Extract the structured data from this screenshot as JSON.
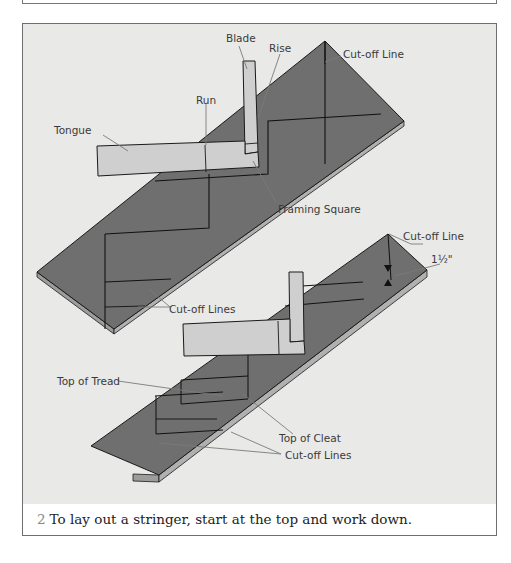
{
  "figure": {
    "number": "2",
    "caption": "To lay out a stringer, start at the top and work down.",
    "colors": {
      "background": "#e9e9e7",
      "stringer_face": "#6f6f6f",
      "stringer_edge": "#a8a8a8",
      "framing_square": "#cfcfcf",
      "outline": "#1a1a1a",
      "leader": "#7a7a7a"
    },
    "top_diagram": {
      "labels": {
        "blade": "Blade",
        "rise": "Rise",
        "run": "Run",
        "tongue": "Tongue",
        "cutoff_line": "Cut-off Line",
        "framing_square": "Framing Square",
        "cutoff_lines": "Cut-off Lines"
      }
    },
    "bottom_diagram": {
      "labels": {
        "cutoff_line": "Cut-off Line",
        "dimension": "1½\"",
        "top_of_tread": "Top of Tread",
        "top_of_cleat": "Top of Cleat",
        "cutoff_lines": "Cut-off Lines"
      }
    }
  }
}
